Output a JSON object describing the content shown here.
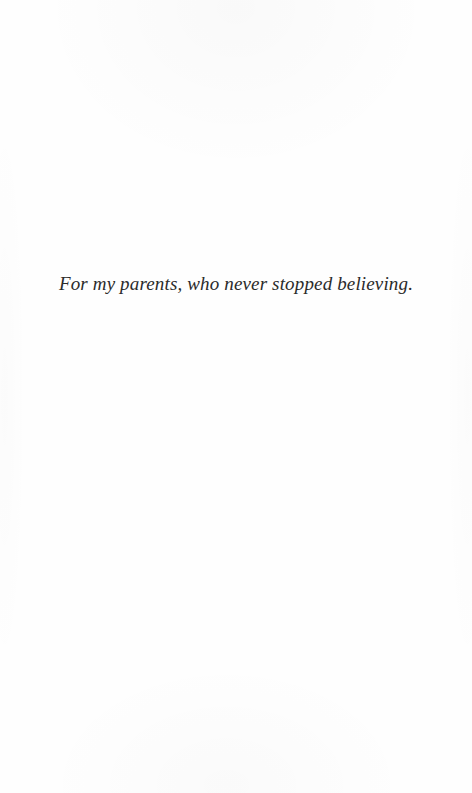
{
  "page": {
    "kind": "book-dedication-page",
    "background_color": "#fefefe",
    "ink_color": "#2b2b2b"
  },
  "dedication": {
    "text": "For my parents, who never stopped believing."
  }
}
